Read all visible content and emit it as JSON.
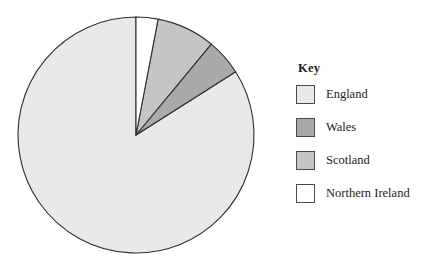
{
  "chart_data": {
    "type": "pie",
    "title": "",
    "legend_position": "right",
    "legend_title": "Key",
    "categories": [
      "England",
      "Wales",
      "Scotland",
      "Northern Ireland"
    ],
    "values": [
      84,
      5,
      8,
      3
    ],
    "unit": "percent",
    "start_angle_deg": 0,
    "direction": "counterclockwise",
    "slices": [
      {
        "label": "England",
        "value": 84,
        "angle_deg": 302.4,
        "color": "#e9e9e9",
        "start_deg": 0,
        "end_deg": 302.4
      },
      {
        "label": "Wales",
        "value": 5,
        "angle_deg": 18,
        "color": "#a9a9a9",
        "start_deg": 302.4,
        "end_deg": 320.4
      },
      {
        "label": "Scotland",
        "value": 8,
        "angle_deg": 28.8,
        "color": "#c5c5c5",
        "start_deg": 320.4,
        "end_deg": 349.2
      },
      {
        "label": "Northern Ireland",
        "value": 3,
        "angle_deg": 10.8,
        "color": "#ffffff",
        "start_deg": 349.2,
        "end_deg": 360
      }
    ],
    "geometry": {
      "center_x": 136,
      "center_y": 135,
      "radius": 118
    },
    "stroke_color": "#2e2e2e",
    "background": "#ffffff"
  },
  "legend": {
    "title": "Key",
    "items": [
      {
        "label": "England",
        "color": "#e9e9e9",
        "swatch_name": "legend-swatch-england"
      },
      {
        "label": "Wales",
        "color": "#a9a9a9",
        "swatch_name": "legend-swatch-wales"
      },
      {
        "label": "Scotland",
        "color": "#c5c5c5",
        "swatch_name": "legend-swatch-scotland"
      },
      {
        "label": "Northern Ireland",
        "color": "#ffffff",
        "swatch_name": "legend-swatch-northern-ireland"
      }
    ]
  }
}
